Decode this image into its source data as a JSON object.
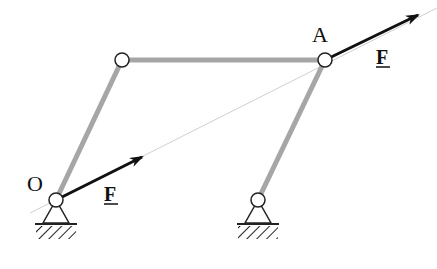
{
  "diagram": {
    "type": "four-bar linkage with applied forces",
    "labels": {
      "origin": "O",
      "point_a": "A",
      "force_at_o": "F",
      "force_at_a": "F"
    },
    "joints": [
      {
        "id": "O",
        "x": 56,
        "y": 200,
        "grounded": true
      },
      {
        "id": "B",
        "x": 122,
        "y": 60,
        "grounded": false
      },
      {
        "id": "A",
        "x": 325,
        "y": 60,
        "grounded": false
      },
      {
        "id": "C",
        "x": 258,
        "y": 200,
        "grounded": true
      }
    ],
    "links": [
      {
        "from": "O",
        "to": "B"
      },
      {
        "from": "B",
        "to": "A"
      },
      {
        "from": "A",
        "to": "C"
      }
    ],
    "forces": [
      {
        "at": "O",
        "label": "F",
        "vector_end": [
          142,
          157
        ]
      },
      {
        "at": "A",
        "label": "F",
        "vector_end": [
          418,
          15
        ]
      }
    ],
    "line_of_action": {
      "from": [
        30,
        213
      ],
      "to": [
        437,
        8
      ]
    },
    "colors": {
      "link": "#a6a6a6",
      "force": "#111111",
      "joint_stroke": "#222222",
      "line_of_action": "#c8c8c8"
    }
  }
}
